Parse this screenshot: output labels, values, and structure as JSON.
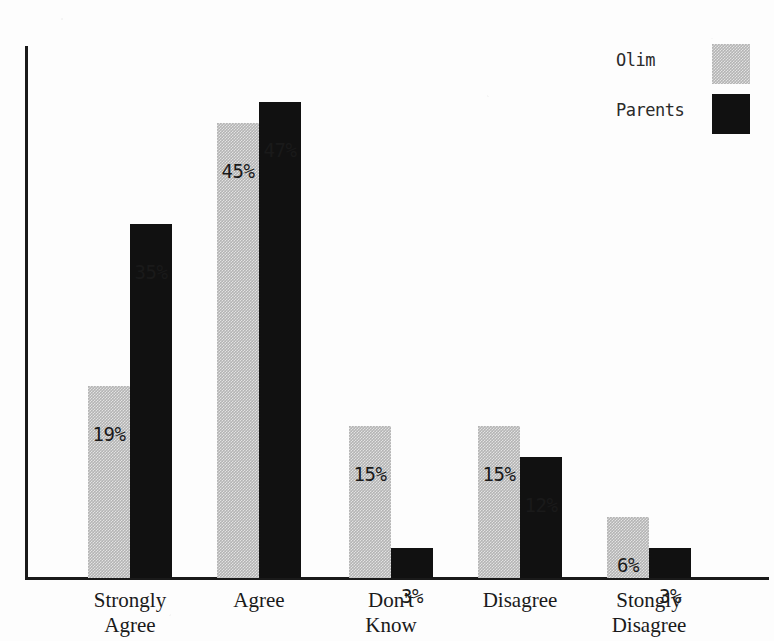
{
  "chart_data": {
    "type": "bar",
    "title": "",
    "subtitle": "",
    "xlabel": "",
    "ylabel": "",
    "ylim": [
      0,
      50
    ],
    "grid": false,
    "legend_position": "top-right",
    "value_suffix": "%",
    "categories": [
      "Strongly\nAgree",
      "Agree",
      "Don't\nKnow",
      "Disagree",
      "Stongly\nDisagree"
    ],
    "series": [
      {
        "name": "Olim",
        "color": "#b4b4b4",
        "pattern": "dither-gray",
        "values": [
          19,
          45,
          15,
          15,
          6
        ],
        "labels": [
          "19%",
          "45%",
          "15%",
          "15%",
          "6%"
        ]
      },
      {
        "name": "Parents",
        "color": "#111111",
        "pattern": "solid-black",
        "values": [
          35,
          47,
          3,
          12,
          3
        ],
        "labels": [
          "35%",
          "47%",
          "3%",
          "12%",
          "3%"
        ]
      }
    ]
  },
  "legend": {
    "entries": [
      {
        "label": "Olim",
        "swatch": "dither-gray-swatch"
      },
      {
        "label": "Parents",
        "swatch": "solid-black-swatch"
      }
    ]
  },
  "axes": {
    "y_axis_line": "vertical-axis",
    "x_axis_line": "horizontal-axis"
  }
}
